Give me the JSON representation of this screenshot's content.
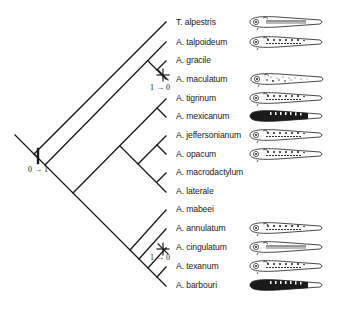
{
  "diagram": {
    "type": "phylogenetic-tree",
    "colors": {
      "line": "#1a1a1a",
      "background": "#ffffff",
      "larva_dark": "#1a1a1a"
    },
    "taxa": [
      {
        "name": "T. alpestris",
        "y": 22,
        "larva": "striped"
      },
      {
        "name": "A. talpoideum",
        "y": 42,
        "larva": "spotted"
      },
      {
        "name": "A. gracile",
        "y": 60,
        "larva": "none"
      },
      {
        "name": "A. maculatum",
        "y": 79,
        "larva": "mottled"
      },
      {
        "name": "A. tigrinum",
        "y": 98,
        "larva": "spotted"
      },
      {
        "name": "A. mexicanum",
        "y": 116,
        "larva": "dark"
      },
      {
        "name": "A. jeffersonianum",
        "y": 135,
        "larva": "spotted"
      },
      {
        "name": "A. opacum",
        "y": 154,
        "larva": "spotted"
      },
      {
        "name": "A. macrodactylum",
        "y": 172,
        "larva": "none"
      },
      {
        "name": "A. laterale",
        "y": 191,
        "larva": "none"
      },
      {
        "name": "A. mabeei",
        "y": 209,
        "larva": "none"
      },
      {
        "name": "A. annulatum",
        "y": 228,
        "larva": "spotted"
      },
      {
        "name": "A. cingulatum",
        "y": 247,
        "larva": "striped"
      },
      {
        "name": "A. texanum",
        "y": 266,
        "larva": "spotted"
      },
      {
        "name": "A. barbouri",
        "y": 285,
        "larva": "dark"
      }
    ],
    "character_changes": [
      {
        "label": "0 → 1",
        "symbol": "bar",
        "position": "root"
      },
      {
        "label": "1 → 0",
        "symbol": "asterisk",
        "position": "A. maculatum branch"
      },
      {
        "label": "1 → 0",
        "symbol": "asterisk",
        "position": "A. cingulatum branch"
      }
    ]
  }
}
